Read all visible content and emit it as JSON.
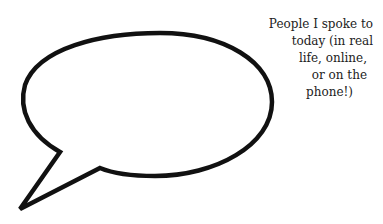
{
  "caption": {
    "lines": [
      "People I spoke to",
      "today (in real",
      "life, online,",
      "or on the",
      "phone!)"
    ]
  },
  "bubble": {
    "stroke_color": "#111111",
    "fill_color": "#ffffff"
  }
}
